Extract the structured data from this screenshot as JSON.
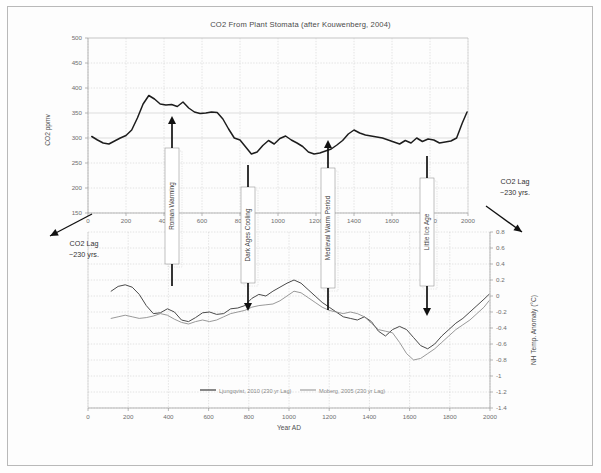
{
  "figure": {
    "title": "CO2 From Plant Stomata (after Kouwenberg, 2004)"
  },
  "chart_data": {
    "type": "line",
    "title": "CO2 From Plant Stomata (after Kouwenberg, 2004)",
    "xlabel": "Year AD",
    "ylabel": "CO2 ppmv",
    "y2label": "NH Temp. Anomaly (°C)",
    "xlim": [
      0,
      2000
    ],
    "ylim": [
      150,
      500
    ],
    "y2lim": [
      -1.4,
      0.8
    ],
    "grid": true,
    "legend_position": "bottom-center",
    "x_ticks": [
      0,
      200,
      400,
      600,
      800,
      1000,
      1200,
      1400,
      1600,
      1800,
      2000
    ],
    "x_tick_labels": [
      "0",
      "200",
      "400",
      "600",
      "800",
      "1000",
      "1200",
      "1400",
      "1600",
      "1800",
      "2000"
    ],
    "y_ticks": [
      150,
      200,
      250,
      300,
      350,
      400,
      450,
      500
    ],
    "y_tick_labels": [
      "150",
      "200",
      "250",
      "300",
      "350",
      "400",
      "450",
      "500"
    ],
    "y2_ticks": [
      -1.4,
      -1.2,
      -1,
      -0.8,
      -0.6,
      -0.4,
      -0.2,
      0,
      0.2,
      0.4,
      0.6,
      0.8
    ],
    "y2_tick_labels": [
      "-1.4",
      "-1.2",
      "-1",
      "-0.8",
      "-0.6",
      "-0.4",
      "-0.2",
      "0",
      "0.2",
      "0.4",
      "0.6",
      "0.8"
    ],
    "series": [
      {
        "name": "CO2 stomata ppmv",
        "axis": "left",
        "color": "#1d1d1d",
        "x": [
          20,
          50,
          80,
          110,
          140,
          170,
          200,
          230,
          260,
          290,
          320,
          350,
          380,
          410,
          440,
          470,
          500,
          530,
          560,
          590,
          620,
          650,
          680,
          710,
          740,
          770,
          800,
          830,
          860,
          890,
          920,
          950,
          980,
          1010,
          1040,
          1070,
          1100,
          1130,
          1160,
          1190,
          1220,
          1250,
          1280,
          1310,
          1340,
          1370,
          1400,
          1430,
          1460,
          1490,
          1520,
          1550,
          1580,
          1610,
          1640,
          1670,
          1700,
          1730,
          1760,
          1790,
          1820,
          1850,
          1880,
          1910,
          1940,
          1970,
          1995
        ],
        "y": [
          303,
          296,
          290,
          288,
          294,
          300,
          305,
          316,
          340,
          368,
          385,
          378,
          368,
          366,
          367,
          363,
          372,
          360,
          352,
          349,
          350,
          352,
          351,
          338,
          318,
          300,
          296,
          282,
          268,
          272,
          285,
          295,
          288,
          299,
          304,
          296,
          290,
          283,
          272,
          268,
          270,
          274,
          278,
          286,
          295,
          308,
          316,
          310,
          306,
          304,
          302,
          300,
          296,
          292,
          288,
          295,
          290,
          300,
          293,
          298,
          296,
          290,
          292,
          294,
          300,
          330,
          352
        ]
      },
      {
        "name": "Ljungqvist, 2010 (230 yr Lag)",
        "axis": "right",
        "color": "#4a4a4a",
        "x": [
          115,
          150,
          185,
          220,
          255,
          290,
          325,
          360,
          395,
          430,
          465,
          500,
          535,
          570,
          605,
          640,
          675,
          710,
          745,
          780,
          815,
          850,
          885,
          920,
          955,
          990,
          1025,
          1060,
          1095,
          1130,
          1165,
          1200,
          1235,
          1270,
          1305,
          1340,
          1375,
          1410,
          1445,
          1480,
          1515,
          1550,
          1585,
          1620,
          1655,
          1690,
          1725,
          1760,
          1795,
          1830,
          1865,
          1900,
          1935,
          1970,
          1995
        ],
        "y": [
          0.06,
          0.12,
          0.14,
          0.11,
          0.02,
          -0.12,
          -0.22,
          -0.21,
          -0.16,
          -0.2,
          -0.3,
          -0.32,
          -0.27,
          -0.21,
          -0.2,
          -0.23,
          -0.22,
          -0.16,
          -0.15,
          -0.12,
          -0.03,
          0.02,
          0.0,
          0.06,
          0.11,
          0.16,
          0.2,
          0.16,
          0.08,
          0.0,
          -0.08,
          -0.14,
          -0.2,
          -0.26,
          -0.28,
          -0.3,
          -0.26,
          -0.32,
          -0.44,
          -0.5,
          -0.42,
          -0.38,
          -0.42,
          -0.52,
          -0.62,
          -0.66,
          -0.6,
          -0.5,
          -0.42,
          -0.34,
          -0.28,
          -0.2,
          -0.12,
          -0.04,
          0.02
        ]
      },
      {
        "name": "Moberg, 2005 (230 yr Lag)",
        "axis": "right",
        "color": "#8d8d8d",
        "x": [
          115,
          150,
          185,
          220,
          255,
          290,
          325,
          360,
          395,
          430,
          465,
          500,
          535,
          570,
          605,
          640,
          675,
          710,
          745,
          780,
          815,
          850,
          885,
          920,
          955,
          990,
          1025,
          1060,
          1095,
          1130,
          1165,
          1200,
          1235,
          1270,
          1305,
          1340,
          1375,
          1410,
          1445,
          1480,
          1515,
          1550,
          1585,
          1620,
          1655,
          1690,
          1725,
          1760,
          1795,
          1830,
          1865,
          1900,
          1935,
          1970,
          1995
        ],
        "y": [
          -0.28,
          -0.26,
          -0.24,
          -0.26,
          -0.28,
          -0.27,
          -0.25,
          -0.22,
          -0.24,
          -0.29,
          -0.33,
          -0.35,
          -0.32,
          -0.3,
          -0.32,
          -0.3,
          -0.26,
          -0.22,
          -0.2,
          -0.18,
          -0.14,
          -0.12,
          -0.11,
          -0.1,
          -0.06,
          0.0,
          0.06,
          0.04,
          -0.02,
          -0.08,
          -0.14,
          -0.18,
          -0.2,
          -0.22,
          -0.2,
          -0.22,
          -0.26,
          -0.34,
          -0.42,
          -0.44,
          -0.46,
          -0.58,
          -0.72,
          -0.8,
          -0.78,
          -0.72,
          -0.66,
          -0.58,
          -0.5,
          -0.42,
          -0.36,
          -0.3,
          -0.22,
          -0.14,
          -0.06
        ]
      }
    ],
    "legend": [
      {
        "label": "Ljungqvist, 2010 (230 yr Lag)",
        "color": "#4a4a4a"
      },
      {
        "label": "Moberg, 2005 (230 yr Lag)",
        "color": "#8d8d8d"
      }
    ],
    "annotations": [
      {
        "id": "roman-warming",
        "label": "Roman Warming",
        "direction": "up",
        "x_year": 270
      },
      {
        "id": "dark-ages-cooling",
        "label": "Dark Ages Cooling",
        "direction": "down",
        "x_year": 640
      },
      {
        "id": "medieval-warm-period",
        "label": "Medieval Warm Period",
        "direction": "up",
        "x_year": 1020
      },
      {
        "id": "little-ice-age",
        "label": "Little Ice Age",
        "direction": "down",
        "x_year": 1600
      },
      {
        "id": "co2-lag-left",
        "label_line1": "CO2 Lag",
        "label_line2": "~230 yrs."
      },
      {
        "id": "co2-lag-right",
        "label_line1": "CO2 Lag",
        "label_line2": "~230 yrs."
      }
    ]
  },
  "labels": {
    "y_axis_title": "CO2 ppmv",
    "y2_axis_title": "NH Temp. Anomaly (°C)",
    "x_axis_title": "Year AD",
    "roman_warming": "Roman Warming",
    "dark_ages_cooling": "Dark Ages Cooling",
    "medieval_warm_period": "Medieval Warm Period",
    "little_ice_age": "Little Ice Age",
    "co2_lag_line1": "CO2 Lag",
    "co2_lag_line2": "~230 yrs.",
    "legend_1": "Ljungqvist, 2010 (230 yr Lag)",
    "legend_2": "Moberg, 2005 (230 yr Lag)"
  },
  "ticks": {
    "top_y": [
      "500",
      "450",
      "400",
      "350",
      "300",
      "250",
      "200",
      "150"
    ],
    "top_x": [
      "0",
      "200",
      "400",
      "600",
      "800",
      "1000",
      "1200",
      "1400",
      "1600",
      "1800",
      "2000"
    ],
    "right_y": [
      "0.8",
      "0.6",
      "0.4",
      "0.2",
      "0",
      "-0.2",
      "-0.4",
      "-0.6",
      "-0.8",
      "-1",
      "-1.2",
      "-1.4"
    ],
    "bottom_x": [
      "0",
      "200",
      "400",
      "600",
      "800",
      "1000",
      "1200",
      "1400",
      "1600",
      "1800",
      "2000"
    ]
  },
  "colors": {
    "co2_line": "#1d1d1d",
    "temp_line_a": "#4a4a4a",
    "temp_line_b": "#8d8d8d",
    "grid": "#c8c8c8",
    "axis": "#9a9a9a",
    "background": "#fdfdfd"
  }
}
